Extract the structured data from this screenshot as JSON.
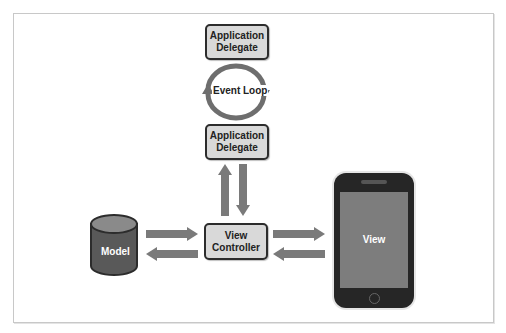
{
  "diagram": {
    "top_delegate": {
      "line1": "Application",
      "line2": "Delegate"
    },
    "event_loop": {
      "label": "Event Loop"
    },
    "bottom_delegate": {
      "line1": "Application",
      "line2": "Delegate"
    },
    "model": {
      "label": "Model"
    },
    "view_controller": {
      "line1": "View",
      "line2": "Controller"
    },
    "device": {
      "screen_label": "View"
    }
  },
  "colors": {
    "box_fill": "#d9d9d9",
    "box_border": "#2c2c2c",
    "arrow": "#7a7a7a",
    "loop": "#6e6e6e",
    "model_fill": "#595959",
    "device_body": "#262626",
    "device_screen": "#7d7d7d"
  }
}
